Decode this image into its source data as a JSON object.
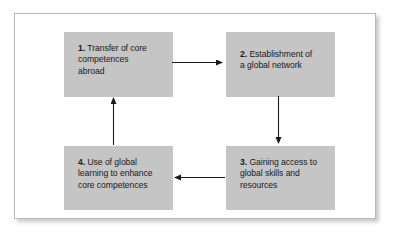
{
  "figure": {
    "type": "cycle-diagram",
    "title": "",
    "box_fill": "#c5c5c5",
    "frame_border": "#b9b9b9",
    "arrow_color": "#1a1a1a",
    "background": "#ffffff"
  },
  "nodes": [
    {
      "number": "1.",
      "lines": [
        "Transfer of core",
        "competences",
        "abroad"
      ],
      "full_text": "1. Transfer of core competences abroad"
    },
    {
      "number": "2.",
      "lines": [
        "Establishment of",
        "a global network"
      ],
      "full_text": "2. Establishment of a global network"
    },
    {
      "number": "3.",
      "lines": [
        "Gaining access to",
        "global skills and",
        "resources"
      ],
      "full_text": "3. Gaining access to global skills and resources"
    },
    {
      "number": "4.",
      "lines": [
        "Use of global",
        "learning to enhance",
        "core competences"
      ],
      "full_text": "4. Use of global learning to enhance core competences"
    }
  ],
  "arrows": [
    {
      "name": "arrow-1-to-2",
      "from": "1",
      "to": "2",
      "direction": "right"
    },
    {
      "name": "arrow-2-to-3",
      "from": "2",
      "to": "3",
      "direction": "down"
    },
    {
      "name": "arrow-3-to-4",
      "from": "3",
      "to": "4",
      "direction": "left"
    },
    {
      "name": "arrow-4-to-1",
      "from": "4",
      "to": "1",
      "direction": "up"
    }
  ]
}
